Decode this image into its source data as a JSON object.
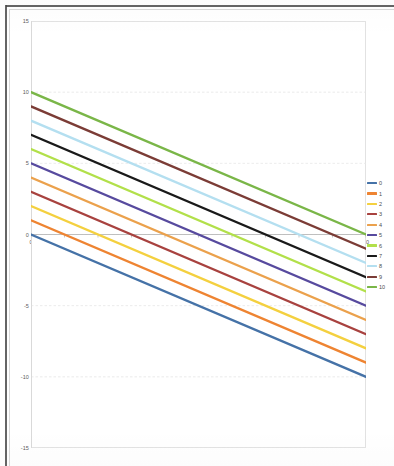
{
  "chart_data": {
    "type": "line",
    "title": "",
    "subtitle": "",
    "xlabel": "",
    "ylabel": "",
    "x": [
      0,
      10
    ],
    "xlim": [
      0,
      10
    ],
    "ylim": [
      -15,
      15
    ],
    "x_ticks": [
      "0",
      "1",
      "2",
      "3",
      "4",
      "5",
      "6",
      "7",
      "8",
      "9",
      "10"
    ],
    "x_tick_values": [
      0,
      1,
      2,
      3,
      4,
      5,
      6,
      7,
      8,
      9,
      10
    ],
    "y_ticks": [
      "15",
      "10",
      "5",
      "0",
      "-5",
      "-10",
      "-15"
    ],
    "y_tick_values": [
      15,
      10,
      5,
      0,
      -5,
      -10,
      -15
    ],
    "grid": "horizontal",
    "legend_position": "right",
    "series": [
      {
        "name": "0",
        "color": "#4572a7",
        "values": [
          0,
          -10
        ],
        "start": 0,
        "end": -10,
        "slope": -1
      },
      {
        "name": "1",
        "color": "#ee8432",
        "values": [
          1,
          -9
        ],
        "start": 1,
        "end": -9,
        "slope": -1
      },
      {
        "name": "2",
        "color": "#f4d03f",
        "values": [
          2,
          -8
        ],
        "start": 2,
        "end": -8,
        "slope": -1
      },
      {
        "name": "3",
        "color": "#a8423f",
        "values": [
          3,
          -7
        ],
        "start": 3,
        "end": -7,
        "slope": -1
      },
      {
        "name": "4",
        "color": "#eba14c",
        "values": [
          4,
          -6
        ],
        "start": 4,
        "end": -6,
        "slope": -1
      },
      {
        "name": "5",
        "color": "#574a9e",
        "values": [
          5,
          -5
        ],
        "start": 5,
        "end": -5,
        "slope": -1
      },
      {
        "name": "6",
        "color": "#b2e04a",
        "values": [
          6,
          -4
        ],
        "start": 6,
        "end": -4,
        "slope": -1
      },
      {
        "name": "7",
        "color": "#1a1a1a",
        "values": [
          7,
          -3
        ],
        "start": 7,
        "end": -3,
        "slope": -1
      },
      {
        "name": "8",
        "color": "#b4dff0",
        "values": [
          8,
          -2
        ],
        "start": 8,
        "end": -2,
        "slope": -1
      },
      {
        "name": "9",
        "color": "#7b3c36",
        "values": [
          9,
          -1
        ],
        "start": 9,
        "end": -1,
        "slope": -1
      },
      {
        "name": "10",
        "color": "#7ab648",
        "values": [
          10,
          0
        ],
        "start": 10,
        "end": 0,
        "slope": -1
      }
    ],
    "legend": [
      "0",
      "1",
      "2",
      "3",
      "4",
      "5",
      "6",
      "7",
      "8",
      "9",
      "10"
    ]
  }
}
